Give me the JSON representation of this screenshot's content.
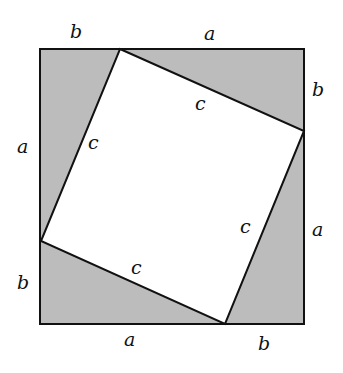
{
  "diagram": {
    "type": "pythagorean-proof-square",
    "colors": {
      "fill": "#bcbcbc",
      "stroke": "#111111",
      "inner": "#ffffff"
    },
    "outer_square": {
      "x1": 40,
      "y1": 49,
      "x2": 304,
      "y2": 324
    },
    "inner_vertices": [
      [
        120,
        49
      ],
      [
        304,
        131
      ],
      [
        225,
        324
      ],
      [
        41,
        241
      ]
    ],
    "labels": {
      "top_b": "b",
      "top_a": "a",
      "right_b": "b",
      "right_a": "a",
      "bottom_a": "a",
      "bottom_b": "b",
      "left_a": "a",
      "left_b": "b",
      "c_top": "c",
      "c_left": "c",
      "c_right": "c",
      "c_bottom": "c"
    }
  }
}
